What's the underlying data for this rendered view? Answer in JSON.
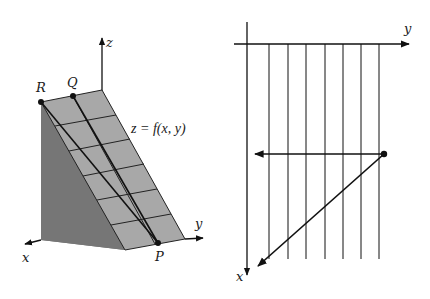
{
  "figure_left": {
    "description": "3D wedge with sloped surface z = f(x, y) and points R, Q, P",
    "axes": {
      "x_label": "x",
      "y_label": "y",
      "z_label": "z"
    },
    "points": {
      "R": "R",
      "Q": "Q",
      "P": "P"
    },
    "surface_label": "z = f(x, y)",
    "colors": {
      "surface": "#a6a6a6",
      "side_wall": "#6e6e6e",
      "front_wall": "#7d7d7d",
      "lines": "#111111"
    }
  },
  "figure_right": {
    "description": "Top-down view: vertical grid lines, horizontal arrow and diagonal arrow from a point",
    "axes": {
      "x_label": "x",
      "y_label": "y"
    },
    "vertical_line_count": 7,
    "colors": {
      "lines": "#111111"
    }
  }
}
